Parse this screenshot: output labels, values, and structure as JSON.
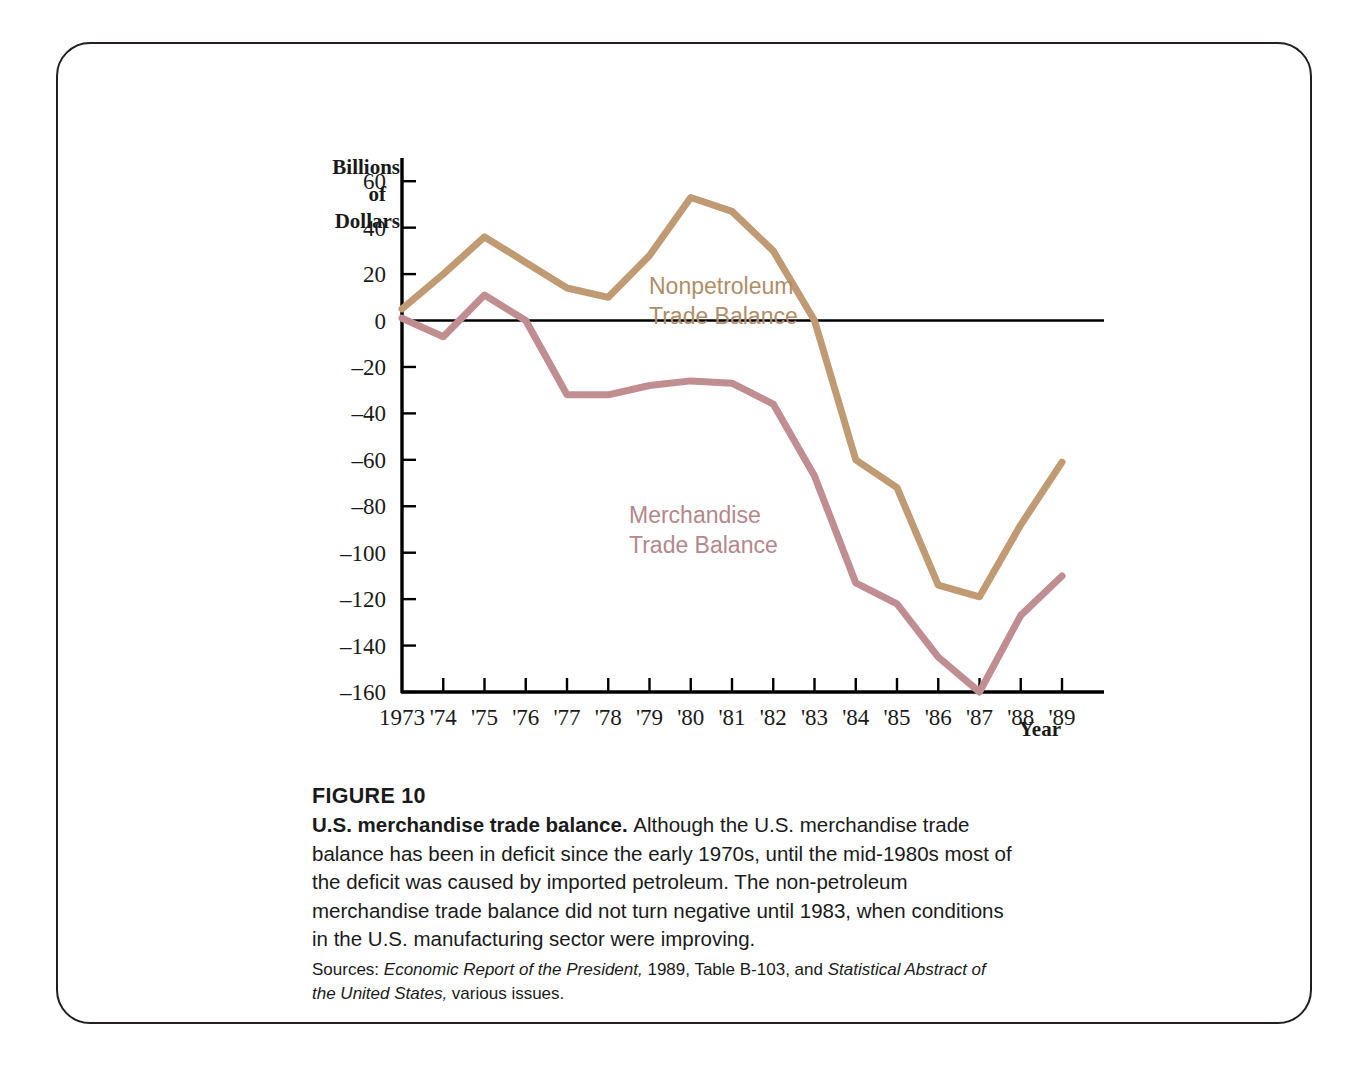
{
  "figure": {
    "number_label": "FIGURE 10",
    "lead_title": "U.S. merchandise trade balance.",
    "body_text": "Although the U.S. merchandise trade balance has been in deficit since the early 1970s, until the mid-1980s most of the deficit was caused by imported petroleum. The non-petroleum merchandise trade balance did not turn negative until 1983, when conditions in the U.S. manufacturing sector were improving.",
    "sources_prefix": "Sources: ",
    "sources_italic_1": "Economic Report of the President,",
    "sources_mid": " 1989, Table B-103, and ",
    "sources_italic_2": "Statistical Abstract of the United States,",
    "sources_tail": " various issues."
  },
  "chart_data": {
    "type": "line",
    "title": "",
    "xlabel": "Year",
    "ylabel": "Billions of Dollars",
    "ylabel_lines": [
      "Billions",
      "of",
      "Dollars"
    ],
    "grid": false,
    "legend": "inline-annotations",
    "x": [
      1973,
      1974,
      1975,
      1976,
      1977,
      1978,
      1979,
      1980,
      1981,
      1982,
      1983,
      1984,
      1985,
      1986,
      1987,
      1988,
      1989
    ],
    "categories": [
      "1973",
      "'74",
      "'75",
      "'76",
      "'77",
      "'78",
      "'79",
      "'80",
      "'81",
      "'82",
      "'83",
      "'84",
      "'85",
      "'86",
      "'87",
      "'88",
      "'89"
    ],
    "xlim": [
      1973,
      1989
    ],
    "ylim": [
      -160,
      70
    ],
    "yticks": [
      60,
      40,
      20,
      0,
      -20,
      -40,
      -60,
      -80,
      -100,
      -120,
      -140,
      -160
    ],
    "ytick_labels": [
      "60",
      "40",
      "20",
      "0",
      "–20",
      "–40",
      "–60",
      "–80",
      "–100",
      "–120",
      "–140",
      "–160"
    ],
    "zero_line": 0,
    "series": [
      {
        "name": "Nonpetroleum Trade Balance",
        "color": "#c09a72",
        "label_lines": [
          "Nonpetroleum",
          "Trade Balance"
        ],
        "values": [
          5,
          20,
          36,
          25,
          14,
          10,
          28,
          53,
          47,
          30,
          0,
          -60,
          -72,
          -114,
          -119,
          -88,
          -61
        ]
      },
      {
        "name": "Merchandise Trade Balance",
        "color": "#c08e91",
        "label_lines": [
          "Merchandise",
          "Trade Balance"
        ],
        "values": [
          1,
          -7,
          11,
          0,
          -32,
          -32,
          -28,
          -26,
          -27,
          -36,
          -67,
          -113,
          -122,
          -145,
          -160,
          -127,
          -110
        ]
      }
    ]
  },
  "colors": {
    "nonpetroleum": "#c09a72",
    "merchandise": "#c08e91",
    "axis": "#000000",
    "frame": "#231f20",
    "text": "#1a1a1a"
  }
}
